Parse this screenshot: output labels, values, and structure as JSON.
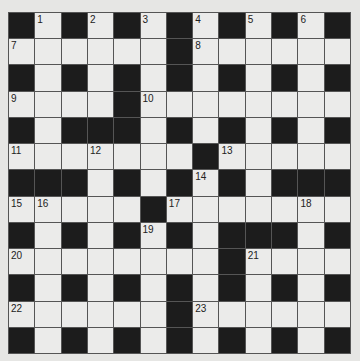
{
  "puzzle": {
    "type": "crossword",
    "size": {
      "rows": 13,
      "cols": 13
    },
    "colors": {
      "background": "#e6e6e4",
      "white_cell": "#ebebea",
      "black_cell": "#1c1c1c",
      "grid_line": "#555555",
      "number_text": "#222222"
    },
    "grid_rows": [
      "#.#.#.#.#.#.#",
      "......#......",
      "#.#.#.#.#.#.#",
      "....#........",
      "#.###.#.#.#.#",
      ".......#.....",
      "###.#.#.#.###",
      ".....#.......",
      "#.#.#.#.###.#",
      "........#....",
      "#.#.#.#.#.#.#",
      "......#......",
      "#.#.#.#.#.#.#"
    ],
    "numbers": [
      {
        "row": 0,
        "col": 1,
        "label": "1"
      },
      {
        "row": 0,
        "col": 3,
        "label": "2"
      },
      {
        "row": 0,
        "col": 5,
        "label": "3"
      },
      {
        "row": 0,
        "col": 7,
        "label": "4"
      },
      {
        "row": 0,
        "col": 9,
        "label": "5"
      },
      {
        "row": 0,
        "col": 11,
        "label": "6"
      },
      {
        "row": 1,
        "col": 0,
        "label": "7"
      },
      {
        "row": 1,
        "col": 7,
        "label": "8"
      },
      {
        "row": 3,
        "col": 0,
        "label": "9"
      },
      {
        "row": 3,
        "col": 5,
        "label": "10"
      },
      {
        "row": 5,
        "col": 0,
        "label": "11"
      },
      {
        "row": 5,
        "col": 3,
        "label": "12"
      },
      {
        "row": 5,
        "col": 8,
        "label": "13"
      },
      {
        "row": 6,
        "col": 7,
        "label": "14"
      },
      {
        "row": 7,
        "col": 0,
        "label": "15"
      },
      {
        "row": 7,
        "col": 1,
        "label": "16"
      },
      {
        "row": 7,
        "col": 6,
        "label": "17"
      },
      {
        "row": 7,
        "col": 11,
        "label": "18"
      },
      {
        "row": 8,
        "col": 5,
        "label": "19"
      },
      {
        "row": 9,
        "col": 0,
        "label": "20"
      },
      {
        "row": 9,
        "col": 9,
        "label": "21"
      },
      {
        "row": 11,
        "col": 0,
        "label": "22"
      },
      {
        "row": 11,
        "col": 7,
        "label": "23"
      }
    ]
  }
}
